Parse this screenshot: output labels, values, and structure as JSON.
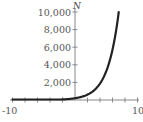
{
  "chart_data": {
    "type": "line",
    "title": "",
    "xlabel": "",
    "ylabel": "N",
    "xlim": [
      -10,
      10
    ],
    "ylim": [
      0,
      10000
    ],
    "x_ticks": [
      -10,
      -8,
      -6,
      -4,
      -2,
      0,
      2,
      4,
      6,
      8,
      10
    ],
    "x_tick_labels": [
      "-10",
      "10"
    ],
    "y_ticks": [
      2000,
      4000,
      6000,
      8000,
      10000
    ],
    "y_tick_labels": [
      "2,000",
      "4,000",
      "6,000",
      "8,000",
      "10,000"
    ],
    "grid": false,
    "legend": null,
    "series": [
      {
        "name": "N",
        "description": "exponential growth curve",
        "x": [
          -10,
          -8,
          -6,
          -4,
          -2,
          0,
          1,
          2,
          3,
          4,
          5,
          6,
          7
        ],
        "values": [
          1,
          3,
          8,
          21,
          60,
          200,
          350,
          600,
          1000,
          1800,
          3000,
          5500,
          10000
        ]
      }
    ]
  },
  "labels": {
    "y_axis_title": "N",
    "x_min": "-10",
    "x_max": "10",
    "y_ticks": [
      "10,000",
      "8,000",
      "6,000",
      "4,000",
      "2,000"
    ]
  }
}
